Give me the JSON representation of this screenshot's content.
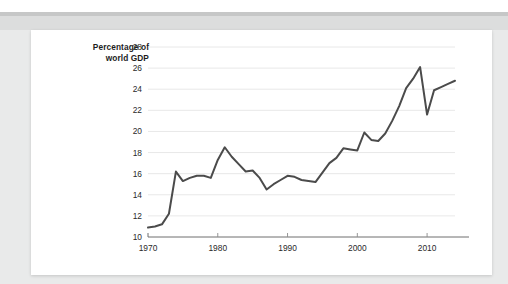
{
  "page": {
    "background_color": "#e9eaea",
    "card_background": "#ffffff",
    "band_color": "#c6c7c7"
  },
  "chart_data": {
    "type": "line",
    "title": "",
    "subtitle": "",
    "ylabel_line1": "Percentage of",
    "ylabel_line2": "world GDP",
    "xlabel": "",
    "xlim": [
      1970,
      2014
    ],
    "ylim": [
      10,
      28
    ],
    "y_ticks": [
      10,
      12,
      14,
      16,
      18,
      20,
      22,
      24,
      26,
      28
    ],
    "y_tick_labels": [
      "10",
      "12",
      "14",
      "16",
      "18",
      "20",
      "22",
      "24",
      "26",
      "28"
    ],
    "x_ticks": [
      1970,
      1980,
      1990,
      2000,
      2010
    ],
    "x_tick_labels": [
      "1970",
      "1980",
      "1990",
      "2000",
      "2010"
    ],
    "grid": "horizontal",
    "legend": "none",
    "line_color": "#4b4b4b",
    "grid_color": "#e2e2e2",
    "axis_color": "#6f6f6f",
    "series": [
      {
        "name": "Percentage of world GDP",
        "x": [
          1970,
          1971,
          1972,
          1973,
          1974,
          1975,
          1976,
          1977,
          1978,
          1979,
          1980,
          1981,
          1982,
          1983,
          1984,
          1985,
          1986,
          1987,
          1988,
          1989,
          1990,
          1991,
          1992,
          1993,
          1994,
          1995,
          1996,
          1997,
          1998,
          1999,
          2000,
          2001,
          2002,
          2003,
          2004,
          2005,
          2006,
          2007,
          2008,
          2009,
          2010,
          2011,
          2012,
          2013,
          2014
        ],
        "values": [
          10.9,
          11.0,
          11.2,
          12.2,
          16.2,
          15.3,
          15.6,
          15.8,
          15.8,
          15.6,
          17.3,
          18.5,
          17.6,
          16.9,
          16.2,
          16.3,
          15.6,
          14.5,
          15.0,
          15.4,
          15.8,
          15.7,
          15.4,
          15.3,
          15.2,
          16.1,
          17.0,
          17.5,
          18.4,
          18.3,
          18.2,
          19.9,
          19.2,
          19.1,
          19.8,
          21.0,
          22.4,
          24.1,
          25.0,
          26.1,
          21.6,
          23.9,
          24.2,
          24.5,
          24.8
        ]
      }
    ],
    "annotations": {
      "peak_year": 2009,
      "peak_value": 26.1,
      "trough_year": 1987,
      "trough_value": 14.5,
      "start_value": 10.9,
      "end_value": 24.8
    }
  }
}
